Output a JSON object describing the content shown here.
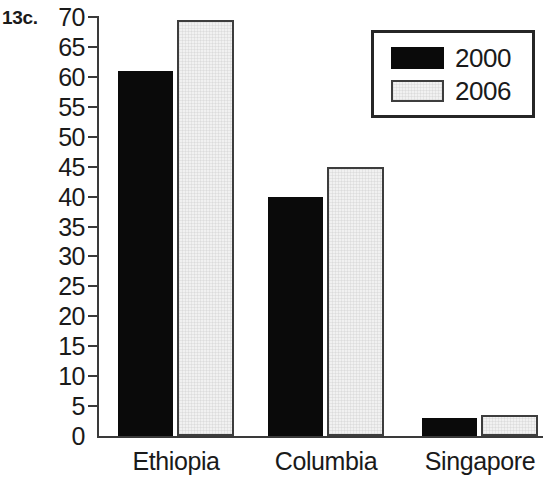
{
  "figure": {
    "number_label": "13c.",
    "background_color": "#ffffff"
  },
  "chart_data": {
    "type": "bar",
    "title": "",
    "xlabel": "",
    "ylabel": "",
    "categories": [
      "Ethiopia",
      "Columbia",
      "Singapore"
    ],
    "series": [
      {
        "name": "2000",
        "color": "#0a0a0a",
        "values": [
          61,
          40,
          3
        ]
      },
      {
        "name": "2006",
        "color": "#f1f1f1",
        "values": [
          69.5,
          45,
          3.5
        ]
      }
    ],
    "ylim": [
      0,
      70
    ],
    "ytick_step": 5,
    "ytick_labels": [
      "70",
      "65",
      "60",
      "55",
      "50",
      "45",
      "40",
      "35",
      "30",
      "25",
      "20",
      "15",
      "10",
      "5",
      "0"
    ],
    "ytick_values": [
      70,
      65,
      60,
      55,
      50,
      45,
      40,
      35,
      30,
      25,
      20,
      15,
      10,
      5,
      0
    ],
    "grid": false,
    "legend": {
      "position": "top-right",
      "entries": [
        "2000",
        "2006"
      ]
    },
    "axis_color": "#3a3a3a"
  }
}
